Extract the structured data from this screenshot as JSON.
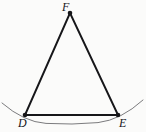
{
  "figure": {
    "kind": "geometry-diagram",
    "width": 146,
    "height": 132,
    "background_color": "#fbfbfa",
    "stroke_color": "#161619",
    "arc_color": "#7b7b7e",
    "triangle_stroke_width": 1.9,
    "arc_stroke_width": 1.0,
    "vertex_dot_radius": 2.3,
    "labels": {
      "apex": "F",
      "bottom_left": "D",
      "bottom_right": "E"
    },
    "points": {
      "F": {
        "x": 70,
        "y": 13
      },
      "D": {
        "x": 25,
        "y": 115
      },
      "E": {
        "x": 118,
        "y": 115
      }
    },
    "segments": [
      {
        "name": "FD",
        "from": "F",
        "to": "D"
      },
      {
        "name": "FE",
        "from": "F",
        "to": "E"
      },
      {
        "name": "DE",
        "from": "D",
        "to": "E"
      }
    ],
    "arc": {
      "name": "arc-through-D-E",
      "start": {
        "x": 2,
        "y": 103
      },
      "end": {
        "x": 143,
        "y": 100
      },
      "sag_point": {
        "x": 72,
        "y": 124
      },
      "path": "M 2 103 Q 24 122 46 123.4 Q 72 125 98 122.6 Q 121 120 143 100"
    }
  }
}
